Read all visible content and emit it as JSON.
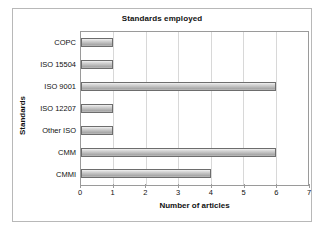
{
  "chart_data": {
    "type": "bar",
    "orientation": "horizontal",
    "title": "Standards employed",
    "xlabel": "Number of articles",
    "ylabel": "Standards",
    "categories": [
      "COPC",
      "ISO 15504",
      "ISO 9001",
      "ISO 12207",
      "Other ISO",
      "CMM",
      "CMMI"
    ],
    "values": [
      1,
      1,
      6,
      1,
      1,
      6,
      4
    ],
    "xlim": [
      0,
      7
    ],
    "xticks": [
      0,
      1,
      2,
      3,
      4,
      5,
      6,
      7
    ],
    "xtick_labels": [
      "0",
      "1",
      "2",
      "3",
      "4",
      "5",
      "6",
      "7"
    ],
    "grid": "vertical",
    "legend": "none",
    "bar_fill_color": "#bdbdbd",
    "bar_border_color": "#6d6d6d",
    "gridline_color": "#d8d8d8",
    "axis_color": "#9a9a9a",
    "background_color": "#ffffff",
    "text_color": "#111111"
  }
}
